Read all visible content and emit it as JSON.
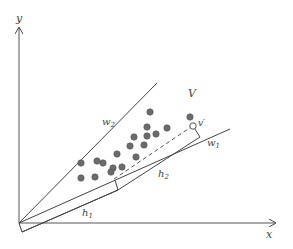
{
  "diagram": {
    "axes": {
      "x_label": "x",
      "y_label": "y"
    },
    "labels": {
      "region": "V",
      "w1": "w",
      "w1_sub": "1",
      "w2": "w",
      "w2_sub": "2",
      "h1": "h",
      "h1_sub": "1",
      "h2": "h",
      "h2_sub": "2",
      "v_prime": "v′"
    },
    "colors": {
      "line": "#444444",
      "dot_fill": "#6b6b6b",
      "dot_stroke": "#555555",
      "open_dot_fill": "#ffffff"
    },
    "origin": [
      19,
      223
    ],
    "points": [
      [
        150,
        112
      ],
      [
        190,
        117
      ],
      [
        147,
        127
      ],
      [
        167,
        128
      ],
      [
        134,
        137
      ],
      [
        147,
        136
      ],
      [
        156,
        134
      ],
      [
        130,
        146
      ],
      [
        144,
        145
      ],
      [
        117,
        154
      ],
      [
        136,
        157
      ],
      [
        81,
        163
      ],
      [
        97,
        161
      ],
      [
        103,
        163
      ],
      [
        113,
        168
      ],
      [
        122,
        167
      ],
      [
        111,
        172
      ],
      [
        81,
        178
      ],
      [
        95,
        177
      ]
    ],
    "open_point": [
      193,
      126
    ]
  }
}
